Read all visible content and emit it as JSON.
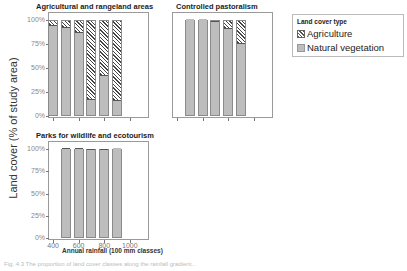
{
  "figure": {
    "ylabel": "Land cover (% of study area)",
    "xlabel": "Annual rainfall (100 mm classes)",
    "yticks": [
      "100%",
      "75%",
      "50%",
      "25%",
      "0%"
    ],
    "xticks": [
      "400",
      "600",
      "800",
      "1000"
    ],
    "caption": "Fig. 4.3 The proportion of land cover classes along the rainfall gradient..."
  },
  "legend": {
    "title": "Land cover type",
    "items": [
      {
        "label": "Agriculture",
        "pattern": "hatched"
      },
      {
        "label": "Natural vegetation",
        "color": "#bdbdbd"
      }
    ]
  },
  "chart_data": [
    {
      "type": "bar",
      "stacked": true,
      "title": "Agricultural and rangeland areas",
      "categories": [
        "400",
        "500",
        "600",
        "700",
        "800",
        "900"
      ],
      "series": [
        {
          "name": "Natural vegetation",
          "values": [
            93,
            91,
            85,
            16,
            41,
            15
          ]
        },
        {
          "name": "Agriculture",
          "values": [
            7,
            9,
            15,
            84,
            59,
            85
          ]
        }
      ],
      "ylim": [
        0,
        100
      ],
      "ylabel": "Land cover (% of study area)"
    },
    {
      "type": "bar",
      "stacked": true,
      "title": "Controlled pastoralism",
      "categories": [
        "500",
        "600",
        "700",
        "800",
        "900"
      ],
      "series": [
        {
          "name": "Natural vegetation",
          "values": [
            100,
            100,
            97,
            90,
            74
          ]
        },
        {
          "name": "Agriculture",
          "values": [
            0,
            0,
            3,
            10,
            26
          ]
        }
      ],
      "ylim": [
        0,
        100
      ]
    },
    {
      "type": "bar",
      "stacked": true,
      "title": "Parks for wildlife and ecotourism",
      "categories": [
        "500",
        "600",
        "700",
        "800",
        "900"
      ],
      "series": [
        {
          "name": "Natural vegetation",
          "values": [
            99,
            99,
            98,
            98,
            100
          ]
        },
        {
          "name": "Agriculture",
          "values": [
            1,
            1,
            2,
            2,
            0
          ]
        }
      ],
      "ylim": [
        0,
        100
      ],
      "xlabel": "Annual rainfall (100 mm classes)"
    }
  ]
}
